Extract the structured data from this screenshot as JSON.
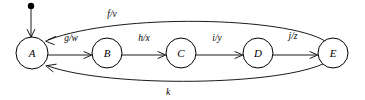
{
  "diagram": {
    "type": "finite-state-machine",
    "title": "",
    "start_marker": {
      "name": "initial-state-marker",
      "target_state": "A"
    },
    "states": [
      {
        "id": "A",
        "label": "A",
        "cx": 32,
        "cy": 53,
        "r": 16
      },
      {
        "id": "B",
        "label": "B",
        "cx": 107,
        "cy": 53,
        "r": 15
      },
      {
        "id": "C",
        "label": "C",
        "cx": 181,
        "cy": 53,
        "r": 15
      },
      {
        "id": "D",
        "label": "D",
        "cx": 258,
        "cy": 53,
        "r": 15
      },
      {
        "id": "E",
        "label": "E",
        "cx": 333,
        "cy": 53,
        "r": 15
      }
    ],
    "transitions": [
      {
        "id": "t_ab",
        "from": "A",
        "to": "B",
        "label": "g/w",
        "label_x": 71,
        "label_y": 41,
        "shape": "straight"
      },
      {
        "id": "t_bc",
        "from": "B",
        "to": "C",
        "label": "h/x",
        "label_x": 144,
        "label_y": 41,
        "shape": "straight"
      },
      {
        "id": "t_cd",
        "from": "C",
        "to": "D",
        "label": "i/y",
        "label_x": 217,
        "label_y": 41,
        "shape": "straight"
      },
      {
        "id": "t_de",
        "from": "D",
        "to": "E",
        "label": "j/z",
        "label_x": 293,
        "label_y": 39,
        "shape": "straight"
      },
      {
        "id": "t_ea_top",
        "from": "E",
        "to": "A",
        "label": "f/v",
        "label_x": 112,
        "label_y": 17,
        "shape": "arc-above"
      },
      {
        "id": "t_ea_bottom",
        "from": "E",
        "to": "A",
        "label": "k",
        "label_x": 168,
        "label_y": 95,
        "shape": "arc-below"
      }
    ],
    "colors": {
      "stroke": "#000000",
      "fill": "#ffffff",
      "background": "#ffffff"
    }
  }
}
